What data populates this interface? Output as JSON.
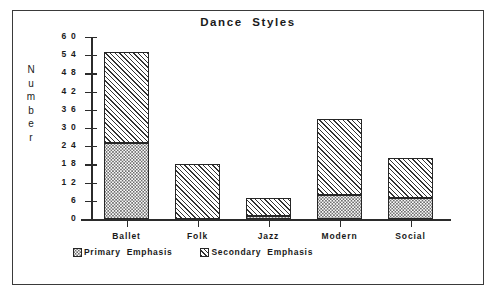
{
  "chart_data": {
    "type": "bar",
    "stacked": true,
    "title": "Dance  Styles",
    "xlabel": "",
    "ylabel": "Number",
    "ylim": [
      0,
      60
    ],
    "ytick_step": 6,
    "yticks": [
      60,
      54,
      48,
      42,
      36,
      30,
      24,
      18,
      12,
      6,
      0
    ],
    "grid": false,
    "legend_position": "bottom-left",
    "categories": [
      "Ballet",
      "Folk",
      "Jazz",
      "Modern",
      "Social"
    ],
    "series": [
      {
        "name": "Primary  Emphasis",
        "pattern": "dots",
        "values": [
          25,
          0,
          1,
          8,
          7
        ]
      },
      {
        "name": "Secondary  Emphasis",
        "pattern": "diagonal-hatch",
        "values": [
          30,
          18,
          6,
          25,
          13
        ]
      }
    ],
    "totals": [
      55,
      18,
      7,
      33,
      20
    ]
  },
  "axis": {
    "y_title_letters": [
      "N",
      "u",
      "m",
      "b",
      "e",
      "r"
    ]
  },
  "colors": {
    "frame": "#3a3a3a",
    "axis": "#2b2b2b",
    "text": "#1a1a1a",
    "background": "#ffffff",
    "hatch": "#333333",
    "dots": "#3a3a3a"
  }
}
